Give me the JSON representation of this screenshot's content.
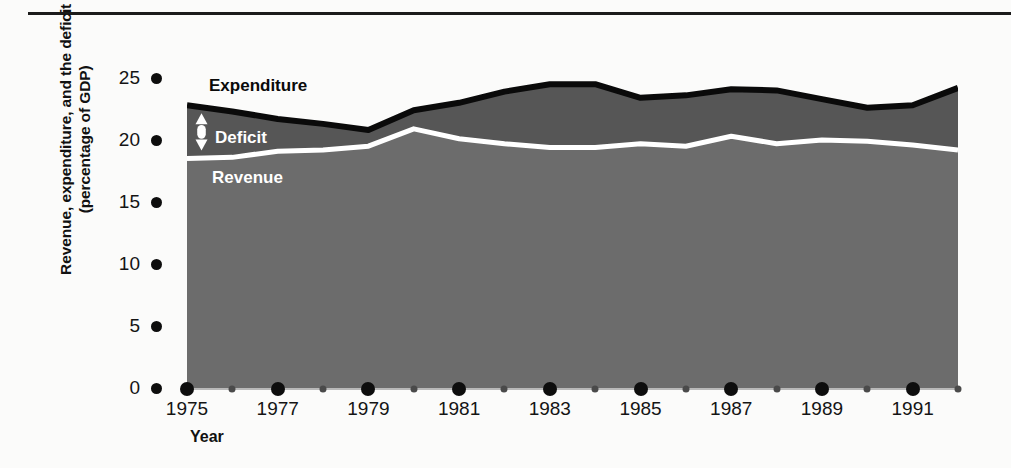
{
  "figure": {
    "background_color": "#fbfbfa",
    "top_rule_color": "#1b1b1b"
  },
  "axis": {
    "y_title_line1": "Revenue, expenditure, and the deficit",
    "y_title_line2": "(percentage of GDP)",
    "x_title": "Year"
  },
  "labels": {
    "expenditure": "Expenditure",
    "deficit": "Deficit",
    "revenue": "Revenue"
  },
  "colors": {
    "expenditure_line": "#0a0a0a",
    "deficit_fill": "#565656",
    "revenue_fill": "#6c6c6c",
    "revenue_line": "#ffffff",
    "tick": "#0d0d0d",
    "minor_tick": "#4a4a4a"
  },
  "chart_data": {
    "type": "area",
    "title": "",
    "subtitle": "",
    "xlabel": "Year",
    "ylabel": "Revenue, expenditure, and the deficit (percentage of GDP)",
    "xlim": [
      1975,
      1992
    ],
    "ylim": [
      0,
      27.5
    ],
    "yticks": [
      0,
      5,
      10,
      15,
      20,
      25
    ],
    "ytick_labels": [
      "0",
      "5",
      "10",
      "15",
      "20",
      "25"
    ],
    "xticks_major": [
      1975,
      1977,
      1979,
      1981,
      1983,
      1985,
      1987,
      1989,
      1991
    ],
    "xticks_minor": [
      1976,
      1978,
      1980,
      1982,
      1984,
      1986,
      1988,
      1990,
      1992
    ],
    "xtick_labels": [
      "1975",
      "1977",
      "1979",
      "1981",
      "1983",
      "1985",
      "1987",
      "1989",
      "1991"
    ],
    "grid": false,
    "legend_position": "inline-annotations",
    "x": [
      1975,
      1976,
      1977,
      1978,
      1979,
      1980,
      1981,
      1982,
      1983,
      1984,
      1985,
      1986,
      1987,
      1988,
      1989,
      1990,
      1991,
      1992
    ],
    "series": [
      {
        "name": "Expenditure",
        "values": [
          22.8,
          22.3,
          21.7,
          21.3,
          20.8,
          22.4,
          23.0,
          23.9,
          24.5,
          24.5,
          23.4,
          23.6,
          24.1,
          24.0,
          23.3,
          22.6,
          22.8,
          24.2
        ]
      },
      {
        "name": "Revenue",
        "values": [
          18.5,
          18.6,
          19.1,
          19.2,
          19.5,
          20.9,
          20.1,
          19.7,
          19.4,
          19.4,
          19.7,
          19.5,
          20.3,
          19.7,
          20.0,
          19.9,
          19.6,
          19.2
        ]
      },
      {
        "name": "Deficit",
        "values": [
          4.3,
          3.7,
          2.6,
          2.1,
          1.3,
          1.5,
          2.9,
          4.2,
          5.1,
          5.1,
          3.7,
          4.1,
          3.8,
          4.3,
          3.3,
          2.7,
          3.2,
          5.0
        ]
      }
    ],
    "annotations": [
      {
        "text": "Expenditure",
        "role": "series-label",
        "color": "#0a0a0a"
      },
      {
        "text": "Deficit",
        "role": "band-label",
        "color": "#ffffff"
      },
      {
        "text": "Revenue",
        "role": "series-label",
        "color": "#ffffff"
      },
      {
        "text": "",
        "role": "deficit-gap-arrow",
        "color": "#ffffff"
      }
    ]
  }
}
